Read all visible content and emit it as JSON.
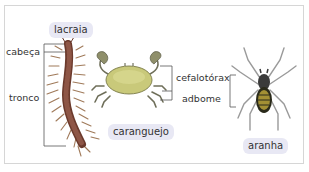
{
  "animals": [
    {
      "name": "lacraia",
      "parts": [
        "cabeça",
        "tronco"
      ]
    },
    {
      "name": "caranguejo",
      "parts": [
        "cefalotórax",
        "adbome"
      ]
    },
    {
      "name": "aranha",
      "parts": [
        "cefalotórax",
        "adbome"
      ]
    }
  ],
  "labels": {
    "lacraia": "lacraia",
    "caranguejo": "caranguejo",
    "aranha": "aranha",
    "cabeca": "cabeça",
    "tronco": "tronco",
    "cefalotorax": "cefalotórax",
    "abdome": "adbome"
  },
  "colors": {
    "pill_bg": "#e8e8f4",
    "frame": "#d6d6d6",
    "centipede": "#7a4a3c",
    "crab_shell": "#c9c97a",
    "spider_legs": "#9a9a9a",
    "spider_abdomen": "#b8a23a"
  }
}
